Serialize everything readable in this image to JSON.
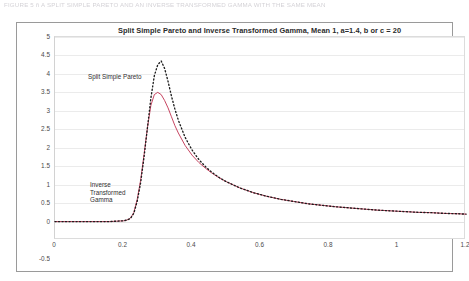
{
  "document": {
    "header_line": "FIGURE 5 ñ A SPLIT SIMPLE PARETO AND AN INVERSE TRANSFORMED GAMMA WITH THE SAME MEAN"
  },
  "chart_data": {
    "type": "line",
    "title": "Split Simple Pareto and Inverse Transformed Gamma, Mean 1, a=1.4, b or c = 20",
    "xlabel": "",
    "ylabel": "",
    "xlim": [
      0,
      1.2
    ],
    "ylim": [
      -0.5,
      5
    ],
    "xticks": [
      "0",
      "0.2",
      "0.4",
      "0.6",
      "0.8",
      "1",
      "1.2"
    ],
    "xtick_values": [
      0,
      0.2,
      0.4,
      0.6,
      0.8,
      1,
      1.2
    ],
    "yticks": [
      "5",
      "4.5",
      "4",
      "3.5",
      "3",
      "2.5",
      "2",
      "1.5",
      "1",
      "0.5",
      "0",
      "-0.5"
    ],
    "ytick_values": [
      5,
      4.5,
      4,
      3.5,
      3,
      2.5,
      2,
      1.5,
      1,
      0.5,
      0,
      -0.5
    ],
    "grid": "horizontal",
    "legend": "none",
    "annotations": [
      {
        "name": "split-simple-pareto",
        "text": "Split Simple Pareto",
        "x": 0.17,
        "y": 4.1
      },
      {
        "name": "inverse-transformed-gamma",
        "lines": [
          "Inverse",
          "Transformed",
          "Gamma"
        ],
        "x": 0.17,
        "y": 1.45
      }
    ],
    "x": [
      0.0,
      0.02,
      0.04,
      0.06,
      0.08,
      0.1,
      0.12,
      0.14,
      0.16,
      0.18,
      0.2,
      0.21,
      0.22,
      0.23,
      0.24,
      0.25,
      0.26,
      0.27,
      0.28,
      0.29,
      0.3,
      0.31,
      0.32,
      0.33,
      0.34,
      0.35,
      0.36,
      0.38,
      0.4,
      0.42,
      0.44,
      0.46,
      0.48,
      0.5,
      0.54,
      0.58,
      0.62,
      0.66,
      0.7,
      0.74,
      0.78,
      0.82,
      0.86,
      0.9,
      0.94,
      0.98,
      1.02,
      1.06,
      1.1,
      1.14,
      1.18,
      1.2
    ],
    "series": [
      {
        "name": "Split Simple Pareto",
        "color": "#1c1c1c",
        "style": "dotted",
        "values": [
          0.0,
          0.0,
          0.0,
          0.0,
          0.0,
          0.0,
          0.0,
          0.0,
          0.0,
          0.01,
          0.02,
          0.04,
          0.08,
          0.22,
          0.55,
          1.05,
          1.75,
          2.55,
          3.35,
          3.95,
          4.25,
          4.35,
          4.15,
          3.8,
          3.4,
          3.05,
          2.75,
          2.28,
          1.94,
          1.68,
          1.48,
          1.32,
          1.19,
          1.08,
          0.91,
          0.78,
          0.68,
          0.6,
          0.54,
          0.48,
          0.44,
          0.4,
          0.37,
          0.34,
          0.31,
          0.29,
          0.27,
          0.25,
          0.24,
          0.22,
          0.21,
          0.2
        ]
      },
      {
        "name": "Inverse Transformed Gamma",
        "color": "#c0304f",
        "style": "solid-dotted",
        "values": [
          0.0,
          0.0,
          0.0,
          0.0,
          0.0,
          0.0,
          0.0,
          0.0,
          0.0,
          0.01,
          0.02,
          0.04,
          0.09,
          0.24,
          0.6,
          1.12,
          1.82,
          2.55,
          3.15,
          3.44,
          3.5,
          3.44,
          3.28,
          3.08,
          2.84,
          2.6,
          2.4,
          2.06,
          1.8,
          1.6,
          1.44,
          1.3,
          1.18,
          1.08,
          0.91,
          0.78,
          0.68,
          0.6,
          0.54,
          0.48,
          0.44,
          0.4,
          0.37,
          0.34,
          0.31,
          0.29,
          0.27,
          0.25,
          0.24,
          0.22,
          0.21,
          0.2
        ]
      }
    ]
  }
}
